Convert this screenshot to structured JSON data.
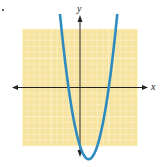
{
  "chart_data": {
    "type": "line",
    "title": "",
    "function": "y = x^2 - 3x - 10",
    "xlabel": "x",
    "ylabel": "y",
    "xlim": [
      -10,
      10
    ],
    "ylim": [
      -10,
      10
    ],
    "grid": true,
    "grid_step": 1,
    "axes_with_arrows": true,
    "curve_arrows": true,
    "x_intercepts": [
      -2,
      5
    ],
    "vertex": [
      1.5,
      -12.25
    ],
    "series": [
      {
        "name": "parabola",
        "x": [
          -4.2,
          -4,
          -3,
          -2,
          -1,
          0,
          1,
          1.5,
          2,
          3,
          4,
          5,
          6,
          7,
          7.2
        ],
        "values": [
          20.24,
          18,
          8,
          0,
          -6,
          -10,
          -12,
          -12.25,
          -12,
          -10,
          -6,
          0,
          8,
          18,
          20.24
        ]
      }
    ]
  },
  "colors": {
    "grid_background": "#f7e3a0",
    "grid_lines": "#fdf5d2",
    "curve": "#2e8bc0",
    "axes": "#222222"
  },
  "labels": {
    "x_axis": "x",
    "y_axis": "y"
  }
}
